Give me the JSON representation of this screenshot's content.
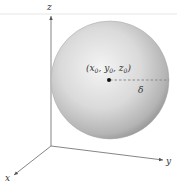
{
  "diagram": {
    "axes": {
      "x_label": "x",
      "y_label": "y",
      "z_label": "z"
    },
    "sphere": {
      "center_label_open": "(",
      "center_x": "x",
      "center_y": "y",
      "center_z": "z",
      "subscript": "0",
      "sep": ", ",
      "close": ")",
      "radius_label": "δ"
    },
    "colors": {
      "axis": "#555555",
      "sphere_light": "#f2f2f2",
      "sphere_mid": "#cfcfcf",
      "sphere_dark": "#9a9a9a",
      "dash": "#8a8a8a",
      "center_dot": "#111111"
    }
  }
}
